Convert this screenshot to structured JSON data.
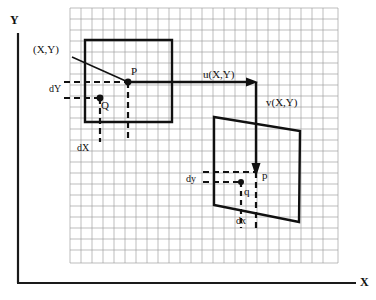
{
  "figure": {
    "title_visible": false,
    "axes": {
      "y_label": "Y",
      "x_label": "X",
      "y_axis_name": "y-axis-line",
      "x_axis_name": "x-axis-line"
    },
    "grid": {
      "visible": true,
      "cell_px": 11,
      "color": "#9a9a9a",
      "left": 70,
      "top": 8,
      "right": 338,
      "bottom": 263,
      "cols": 24,
      "rows": 23
    },
    "colors": {
      "ink": "#111111",
      "grid": "#9a9a9a",
      "axis": "#1a1a1a",
      "background": "#ffffff"
    },
    "labels": {
      "source_point": "(X,Y)",
      "point_P": "P",
      "point_Q": "Q",
      "delta_Y": "dY",
      "delta_X": "dX",
      "u_component": "u(X,Y)",
      "v_component": "v(X,Y)",
      "point_p_lower": "p",
      "point_q_lower": "q",
      "delta_y": "dy",
      "delta_x": "dx"
    },
    "shapes": {
      "source_square": {
        "name": "source-square",
        "points": "85,40 172,40 172,122 85,122"
      },
      "target_quad": {
        "name": "target-quadrilateral",
        "points": "214,117 300,131 299,222 214,205"
      }
    },
    "vectors": {
      "u": {
        "from": [
          128,
          82
        ],
        "to": [
          256,
          82
        ],
        "orientation": "horizontal"
      },
      "v": {
        "from": [
          256,
          82
        ],
        "to": [
          256,
          174
        ],
        "orientation": "vertical"
      }
    },
    "points": {
      "P": [
        128,
        82
      ],
      "Q": [
        100,
        98
      ],
      "p": [
        256,
        173
      ],
      "q": [
        241,
        182
      ]
    }
  }
}
